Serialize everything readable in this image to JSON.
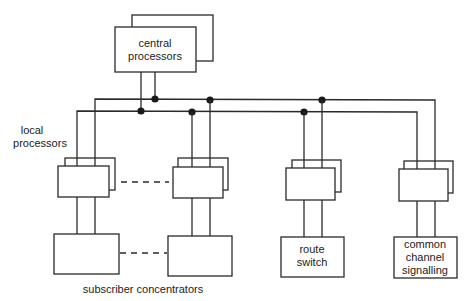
{
  "diagram": {
    "type": "block-diagram",
    "central": {
      "label_line1": "central",
      "label_line2": "processors"
    },
    "local_label": {
      "line1": "local",
      "line2": "processors"
    },
    "route_switch": {
      "line1": "route",
      "line2": "switch"
    },
    "ccs": {
      "line1": "common",
      "line2": "channel",
      "line3": "signalling"
    },
    "subscriber_label": "subscriber concentrators",
    "colors": {
      "line": "#2a2a2a",
      "background": "#ffffff"
    }
  }
}
